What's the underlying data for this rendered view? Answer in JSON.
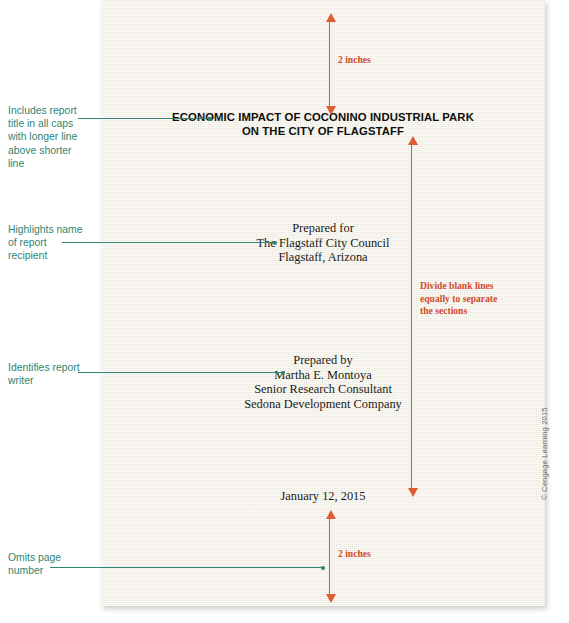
{
  "document": {
    "title_lines": [
      "ECONOMIC IMPACT OF COCONINO INDUSTRIAL PARK",
      "ON THE CITY OF FLAGSTAFF"
    ],
    "prepared_for": {
      "heading": "Prepared for",
      "line1": "The Flagstaff City Council",
      "line2": "Flagstaff, Arizona"
    },
    "prepared_by": {
      "heading": "Prepared by",
      "line1": "Martha E. Montoya",
      "line2": "Senior Research Consultant",
      "line3": "Sedona Development Company"
    },
    "date": "January 12, 2015"
  },
  "annotations": {
    "measurements": {
      "top_margin": "2 inches",
      "bottom_margin": "2 inches",
      "divide_lines": [
        "Divide blank lines",
        "equally to separate",
        "the sections"
      ]
    },
    "callouts": {
      "title": [
        "Includes report",
        "title in all caps",
        "with longer line",
        "above shorter",
        "line"
      ],
      "recipient": [
        "Highlights name",
        "of report",
        "recipient"
      ],
      "writer": [
        "Identifies report",
        "writer"
      ],
      "page_number": [
        "Omits page",
        "number"
      ]
    }
  },
  "copyright": "© Cengage Learning 2015",
  "colors": {
    "page": "#f2efe6",
    "callout_teal": "#2f8473",
    "measure_red": "#e05a33",
    "label_red": "#d4492a",
    "body_text": "#1d1d1b"
  }
}
